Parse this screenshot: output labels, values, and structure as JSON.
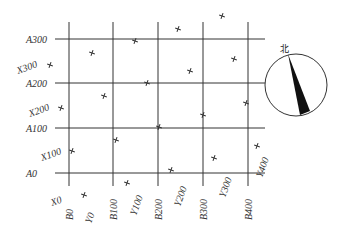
{
  "diagram": {
    "type": "survey-grid-with-compass",
    "grid": {
      "row_labels": [
        "A300",
        "A200",
        "A100",
        "A0"
      ],
      "column_labels": [
        "B0",
        "B100",
        "B200",
        "B300",
        "B400"
      ],
      "x_axis_labels": [
        "X300",
        "X200",
        "X100",
        "X0"
      ],
      "y_axis_labels": [
        "Y0",
        "Y100",
        "Y200",
        "Y300",
        "Y400"
      ]
    },
    "compass": {
      "north_label": "北"
    },
    "colors": {
      "line": "#333333",
      "background": "#ffffff"
    }
  }
}
